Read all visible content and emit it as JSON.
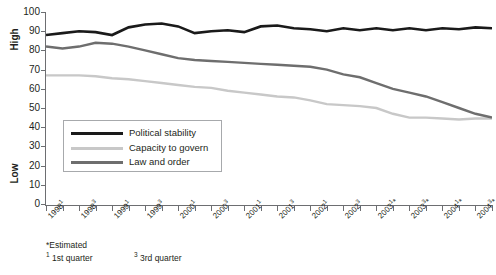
{
  "axis": {
    "y_high_label": "High",
    "y_low_label": "Low",
    "y_ticks": [
      "100",
      "90",
      "80",
      "70",
      "60",
      "50",
      "40",
      "30",
      "20",
      "10",
      "0"
    ]
  },
  "legend": {
    "items": [
      {
        "label": "Political stability",
        "color": "#1a1a1a",
        "name": "political-stability"
      },
      {
        "label": "Capacity to govern",
        "color": "#c8c8c8",
        "name": "capacity-to-govern"
      },
      {
        "label": "Law and order",
        "color": "#6e6e6e",
        "name": "law-and-order"
      }
    ]
  },
  "footnotes": {
    "estimated": "*Estimated",
    "q1_mark": "1",
    "q1_text": "1st quarter",
    "q3_mark": "3",
    "q3_text": "3rd quarter"
  },
  "source_strip": "",
  "chart_data": {
    "type": "line",
    "title": "",
    "xlabel": "",
    "ylabel": "",
    "ylim": [
      0,
      100
    ],
    "ytick_step": 10,
    "grid": false,
    "legend_position": "inside-lower-left",
    "x": [
      "1998Q1",
      "1998Q2",
      "1998Q3",
      "1998Q4",
      "1999Q1",
      "1999Q2",
      "1999Q3",
      "1999Q4",
      "2000Q1",
      "2000Q2",
      "2000Q3",
      "2000Q4",
      "2001Q1",
      "2001Q2",
      "2001Q3",
      "2001Q4",
      "2002Q1",
      "2002Q2",
      "2002Q3",
      "2002Q4",
      "2003Q1",
      "2003Q2",
      "2003Q3",
      "2003Q4",
      "2004Q1",
      "2004Q2",
      "2004Q3",
      "2004Q4"
    ],
    "tick_labels": [
      {
        "index": 0,
        "text": "1998",
        "sup": "1",
        "est": false
      },
      {
        "index": 2,
        "text": "1998",
        "sup": "3",
        "est": false
      },
      {
        "index": 4,
        "text": "1999",
        "sup": "1",
        "est": false
      },
      {
        "index": 6,
        "text": "1999",
        "sup": "3",
        "est": false
      },
      {
        "index": 8,
        "text": "2000",
        "sup": "1",
        "est": false
      },
      {
        "index": 10,
        "text": "2000",
        "sup": "3",
        "est": false
      },
      {
        "index": 12,
        "text": "2001",
        "sup": "1",
        "est": false
      },
      {
        "index": 14,
        "text": "2001",
        "sup": "3",
        "est": false
      },
      {
        "index": 16,
        "text": "2002",
        "sup": "1",
        "est": false
      },
      {
        "index": 18,
        "text": "2002",
        "sup": "3",
        "est": false
      },
      {
        "index": 20,
        "text": "2003",
        "sup": "1",
        "est": true
      },
      {
        "index": 22,
        "text": "2003",
        "sup": "3",
        "est": true
      },
      {
        "index": 24,
        "text": "2004",
        "sup": "1",
        "est": true
      },
      {
        "index": 26,
        "text": "2004",
        "sup": "3",
        "est": true
      }
    ],
    "series": [
      {
        "name": "Political stability",
        "color": "#1a1a1a",
        "width": 2.6,
        "values": [
          88,
          89,
          90,
          89.5,
          88,
          92,
          93.5,
          94,
          92.5,
          89,
          90,
          90.5,
          89.5,
          92.5,
          93,
          91.5,
          91,
          90,
          91.5,
          90.5,
          91.5,
          90.5,
          91.5,
          90.5,
          91.5,
          91,
          92,
          91.5
        ]
      },
      {
        "name": "Capacity to govern",
        "color": "#c8c8c8",
        "width": 2.4,
        "values": [
          67,
          67,
          67,
          66.5,
          65.5,
          65,
          64,
          63,
          62,
          61,
          60.5,
          59,
          58,
          57,
          56,
          55.5,
          54,
          52,
          51.5,
          51,
          50,
          47,
          45,
          45,
          44.5,
          44,
          44.5,
          44.5
        ]
      },
      {
        "name": "Law and order",
        "color": "#6e6e6e",
        "width": 2.4,
        "values": [
          82,
          81,
          82,
          84,
          83.5,
          82,
          80,
          78,
          76,
          75,
          74.5,
          74,
          73.5,
          73,
          72.5,
          72,
          71.5,
          70,
          67.5,
          66,
          63,
          60,
          58,
          56,
          53,
          50,
          47,
          45
        ]
      }
    ]
  }
}
